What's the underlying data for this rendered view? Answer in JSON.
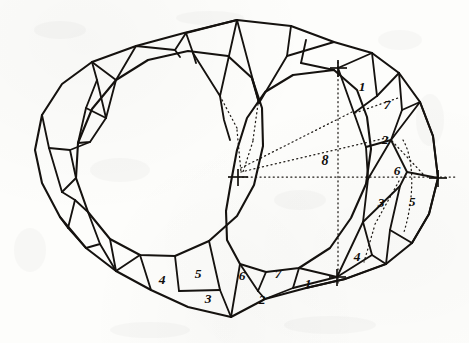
{
  "document": {
    "kind": "hand-drawn-technical-diagram",
    "subject": "Faceted gemstone cutting layout — two overlapping polygonal outlines with numbered facet rows",
    "medium": "pencil on paper",
    "background_color": "#fdfdfb",
    "ink_color": "#15120f"
  },
  "canvas": {
    "width": 469,
    "height": 343
  },
  "labels": {
    "right_group": [
      {
        "id": "r1",
        "text": "1",
        "x": 362,
        "y": 88
      },
      {
        "id": "r7",
        "text": "7",
        "x": 387,
        "y": 106
      },
      {
        "id": "r2",
        "text": "2",
        "x": 385,
        "y": 141
      },
      {
        "id": "r6",
        "text": "6",
        "x": 397,
        "y": 172
      },
      {
        "id": "r3",
        "text": "3",
        "x": 381,
        "y": 204
      },
      {
        "id": "r5",
        "text": "5",
        "x": 412,
        "y": 203
      },
      {
        "id": "r4",
        "text": "4",
        "x": 357,
        "y": 258
      }
    ],
    "center_label": {
      "id": "c8",
      "text": "8",
      "x": 325,
      "y": 162
    },
    "bottom_group": [
      {
        "id": "b4",
        "text": "4",
        "x": 162,
        "y": 281
      },
      {
        "id": "b5",
        "text": "5",
        "x": 198,
        "y": 275
      },
      {
        "id": "b3",
        "text": "3",
        "x": 208,
        "y": 300
      },
      {
        "id": "b6",
        "text": "6",
        "x": 242,
        "y": 277
      },
      {
        "id": "b2",
        "text": "2",
        "x": 262,
        "y": 301
      },
      {
        "id": "b7",
        "text": "7",
        "x": 278,
        "y": 275
      },
      {
        "id": "b1",
        "text": "1",
        "x": 308,
        "y": 285
      }
    ]
  },
  "index_marks": [
    {
      "id": "center-left-pivot",
      "x": 237,
      "y": 176
    },
    {
      "id": "top-right-index",
      "x": 338,
      "y": 68
    },
    {
      "id": "right-index",
      "x": 438,
      "y": 178
    },
    {
      "id": "bottom-right-index",
      "x": 337,
      "y": 277
    }
  ],
  "geometry": {
    "left_polygon": "M 148,60 L 188,51 L 228,56 L 252,78 L 262,108 L 262,146 L 253,185 L 236,215 L 209,241 L 175,256 L 140,255 L 110,239 L 88,212 L 76,178 L 78,143 L 92,109 L 116,80 Z",
    "right_polygon": "M 334,70 L 356,89 L 366,116 L 370,148 L 365,184 L 350,218 L 330,248 L 299,268 L 266,272 L 240,265 L 226,240 L 225,211 L 231,182 L 236,150 L 246,118 L 264,92 L 292,75 Z",
    "outer_rim": "M 237,20 L 291,26 L 334,42 L 372,53 L 399,73 L 420,102 L 433,136 L 438,178 L 429,214 L 412,243 L 386,264 L 345,279 L 306,288 L 265,299 L 231,317 L 188,307 L 151,290 L 116,271 L 86,248 L 60,217 L 42,183 L 35,150 L 42,115 L 62,84 L 92,62 L 136,46 L 184,33 Z"
  },
  "facet_rows": {
    "bottom_row_labels": [
      "4",
      "5",
      "3",
      "6",
      "2",
      "7",
      "1"
    ],
    "right_column_labels": [
      "1",
      "7",
      "2",
      "6",
      "3",
      "5",
      "4"
    ],
    "axis_label": "8"
  }
}
